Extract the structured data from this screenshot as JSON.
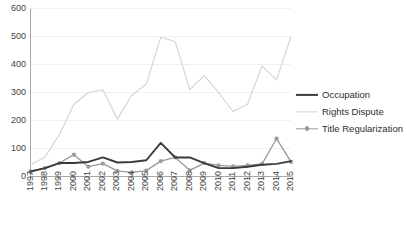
{
  "chart_data": {
    "type": "line",
    "title": "",
    "xlabel": "",
    "ylabel": "",
    "x": [
      1997,
      1998,
      1999,
      2000,
      2001,
      2002,
      2003,
      2004,
      2005,
      2006,
      2007,
      2008,
      2009,
      2010,
      2011,
      2012,
      2013,
      2014,
      2015
    ],
    "categories": [
      "1997",
      "1998",
      "1999",
      "2000",
      "2001",
      "2002",
      "2003",
      "2004",
      "2005",
      "2006",
      "2007",
      "2008",
      "2009",
      "2010",
      "2011",
      "2012",
      "2013",
      "2014",
      "2015"
    ],
    "ylim": [
      0,
      600
    ],
    "yticks": [
      0,
      100,
      200,
      300,
      400,
      500,
      600
    ],
    "ytick_labels": [
      "0",
      "100",
      "200",
      "300",
      "400",
      "500",
      "600"
    ],
    "grid": true,
    "legend_position": "right",
    "series": [
      {
        "name": "Occupation",
        "color": "#3b3b3b",
        "marker": "none",
        "values": [
          18,
          30,
          48,
          48,
          52,
          68,
          50,
          52,
          58,
          120,
          68,
          68,
          48,
          30,
          30,
          35,
          42,
          45,
          55
        ]
      },
      {
        "name": "Rights Dispute",
        "color": "#d2d2d2",
        "marker": "none",
        "values": [
          42,
          70,
          150,
          258,
          300,
          310,
          205,
          290,
          330,
          497,
          482,
          310,
          360,
          300,
          232,
          258,
          395,
          345,
          500
        ]
      },
      {
        "name": "Title Regularization",
        "color": "#9a9a9a",
        "marker": "circle",
        "values": [
          18,
          30,
          48,
          78,
          35,
          46,
          20,
          15,
          21,
          55,
          68,
          22,
          48,
          40,
          36,
          40,
          45,
          135,
          52
        ]
      }
    ]
  },
  "legend": {
    "items": [
      {
        "label": "Occupation"
      },
      {
        "label": "Rights Dispute"
      },
      {
        "label": "Title Regularization"
      }
    ]
  },
  "axes": {
    "y_labels": [
      "600",
      "500",
      "400",
      "300",
      "200",
      "100",
      "0"
    ],
    "x_labels": [
      "1997",
      "1998",
      "1999",
      "2000",
      "2001",
      "2002",
      "2003",
      "2004",
      "2005",
      "2006",
      "2007",
      "2008",
      "2009",
      "2010",
      "2011",
      "2012",
      "2013",
      "2014",
      "2015"
    ]
  }
}
